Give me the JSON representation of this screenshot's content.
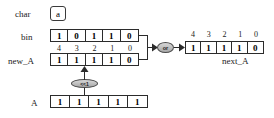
{
  "diagram": {
    "background": "#ffffff",
    "stroke": "#2b2b2b",
    "operator_fill": "#bdbdbd"
  },
  "char_row": {
    "label": "char",
    "value": "a"
  },
  "bin_row": {
    "label": "bin",
    "bits": [
      "1",
      "0",
      "1",
      "1",
      "0"
    ]
  },
  "new_a_row": {
    "label": "new_A",
    "indices": [
      "4",
      "3",
      "2",
      "1",
      "0"
    ],
    "bits": [
      "1",
      "1",
      "1",
      "1",
      "0"
    ]
  },
  "a_row": {
    "label": "A",
    "bits": [
      "1",
      "1",
      "1",
      "1",
      "1"
    ]
  },
  "next_a_row": {
    "label": "next_A",
    "indices": [
      "4",
      "3",
      "2",
      "1",
      "0"
    ],
    "bits": [
      "1",
      "1",
      "1",
      "1",
      "0"
    ]
  },
  "operators": {
    "or": "or",
    "shift": "<<1"
  }
}
